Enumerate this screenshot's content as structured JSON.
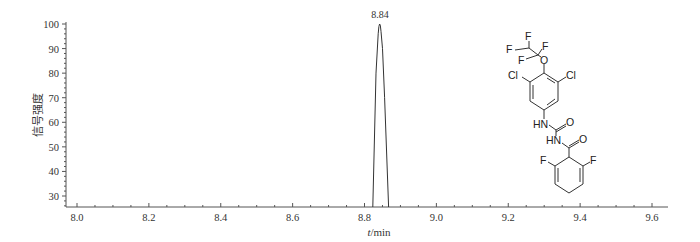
{
  "chart_data": {
    "type": "line",
    "title": "",
    "xlabel": "t/min",
    "xlabel_italic_part": "t",
    "xlabel_unit_part": "/min",
    "ylabel": "信号强度",
    "xlim": [
      7.97,
      9.64
    ],
    "ylim": [
      25.5,
      100
    ],
    "x_ticks": [
      8.0,
      8.2,
      8.4,
      8.6,
      8.8,
      9.0,
      9.2,
      9.4,
      9.6
    ],
    "x_tick_labels": [
      "8.0",
      "8.2",
      "8.4",
      "8.6",
      "8.8",
      "9.0",
      "9.2",
      "9.4",
      "9.6"
    ],
    "x_minor_step": 0.05,
    "y_ticks": [
      30,
      40,
      50,
      60,
      70,
      80,
      90,
      100
    ],
    "y_tick_labels": [
      "30",
      "40",
      "50",
      "60",
      "70",
      "80",
      "90",
      "100"
    ],
    "y_minor_step": 2,
    "grid": false,
    "legend": null,
    "series": [
      {
        "name": "chromatogram",
        "x": [
          8.823,
          8.832,
          8.838,
          8.84,
          8.842,
          8.844,
          8.846,
          8.85,
          8.856,
          8.867
        ],
        "y": [
          25.5,
          80,
          96,
          99,
          100,
          99.5,
          97,
          90,
          70,
          25.5
        ]
      }
    ],
    "annotations": [
      {
        "text": "8.84",
        "x": 8.84,
        "y": 100,
        "type": "peak-label"
      }
    ],
    "inset": {
      "type": "chemical-structure",
      "atom_labels": [
        "F",
        "F",
        "F",
        "F",
        "O",
        "Cl",
        "Cl",
        "HN",
        "O",
        "HN",
        "O",
        "F",
        "F"
      ]
    }
  },
  "labels": {
    "peak": "8.84",
    "ylabel": "信号强度",
    "xlabel_italic": "t",
    "xlabel_unit": "/min"
  },
  "molecule": {
    "f_top": "F",
    "f_left": "F",
    "f_right": "F",
    "f_lower": "F",
    "o_ether": "O",
    "cl_left": "Cl",
    "cl_right": "Cl",
    "hn_1": "HN",
    "o_urea": "O",
    "hn_2": "HN",
    "o_amide": "O",
    "f_ring_left": "F",
    "f_ring_right": "F"
  }
}
